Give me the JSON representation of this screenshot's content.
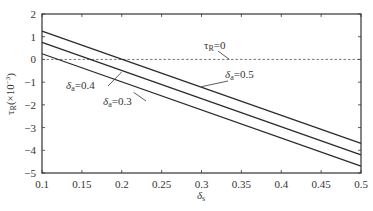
{
  "chart_data": {
    "type": "line",
    "title": "",
    "xlabel": "δ_s",
    "ylabel": "τ_R (×10⁻³)",
    "xlim": [
      0.1,
      0.5
    ],
    "ylim": [
      -5,
      2
    ],
    "xticks": [
      0.1,
      0.15,
      0.2,
      0.25,
      0.3,
      0.35,
      0.4,
      0.45,
      0.5
    ],
    "xtick_labels": [
      "0.1",
      "0.15",
      "0.2",
      "0.25",
      "0.3",
      "0.35",
      "0.4",
      "0.45",
      "0.5"
    ],
    "yticks": [
      2,
      1,
      0,
      -1,
      -2,
      -3,
      -4,
      -5
    ],
    "ytick_labels": [
      "2",
      "1",
      "0",
      "−1",
      "−2",
      "−3",
      "−4",
      "−5"
    ],
    "grid": false,
    "legend": "none (inline annotations)",
    "x": [
      0.1,
      0.5
    ],
    "series": [
      {
        "name": "δ_a=0.5",
        "values": [
          1.25,
          -3.7
        ]
      },
      {
        "name": "δ_a=0.4",
        "values": [
          0.75,
          -4.2
        ]
      },
      {
        "name": "δ_a=0.3",
        "values": [
          0.25,
          -4.7
        ]
      }
    ],
    "reference_lines": [
      {
        "name": "τ_R=0",
        "y": 0,
        "style": "dashed"
      }
    ],
    "annotations": [
      {
        "text": "τ_R=0",
        "x": 0.32,
        "y": 0.55,
        "points_to": [
          0.335,
          0
        ]
      },
      {
        "text": "δ_a=0.5",
        "x": 0.335,
        "y": -0.65,
        "points_to": [
          0.3,
          -1.2
        ]
      },
      {
        "text": "δ_a=0.4",
        "x": 0.115,
        "y": -1.0,
        "points_to": [
          0.2,
          -0.55
        ]
      },
      {
        "text": "δ_a=0.3",
        "x": 0.17,
        "y": -1.75,
        "points_to": [
          0.215,
          -1.45
        ]
      }
    ]
  },
  "labels": {
    "xlabel_main": "δ",
    "xlabel_sub": "s",
    "ylabel_main": "τ",
    "ylabel_sub": "R",
    "ylabel_rest": "(×10",
    "ylabel_exp": "−3",
    "ylabel_close": ")",
    "tau_zero_main": "τ",
    "tau_zero_sub": "R",
    "tau_zero_rest": "=0",
    "s05_main": "δ",
    "s05_sub": "a",
    "s05_rest": "=0.5",
    "s04_main": "δ",
    "s04_sub": "a",
    "s04_rest": "=0.4",
    "s03_main": "δ",
    "s03_sub": "a",
    "s03_rest": "=0.3"
  },
  "colors": {
    "line": "#2b2b2b",
    "axis": "#333333",
    "text": "#333333",
    "background": "#ffffff"
  }
}
